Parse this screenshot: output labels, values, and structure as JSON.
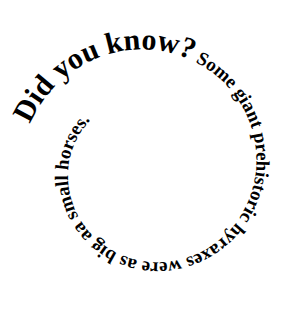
{
  "spiral": {
    "full_text": "Did you know? Some giant prehistoric hyraxes were as big aa small horses.",
    "segments": [
      {
        "text": "Did you know?",
        "size": 30,
        "weight": "bold"
      },
      {
        "text": " Some giant prehistoric hyraxes were as big aa small horses.",
        "size": 19,
        "weight": "normal"
      }
    ],
    "text_color": "#000000",
    "background_color": "#ffffff"
  }
}
